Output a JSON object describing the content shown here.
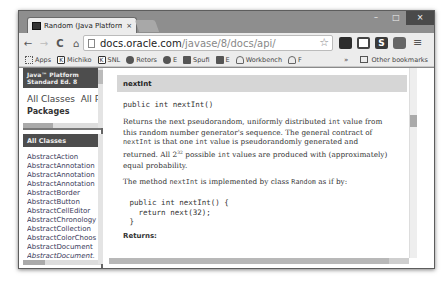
{
  "browser": {
    "tab": {
      "title": "Random (Java Platform SE",
      "close_glyph": "×"
    },
    "window_controls": {
      "minimize": "–",
      "maximize": "□",
      "close": "×"
    },
    "nav": {
      "back": "←",
      "forward": "→",
      "reload": "C",
      "home": "⌂"
    },
    "omnibox": {
      "host": "docs.oracle.com",
      "path": "/javase/8/docs/api/",
      "star": "☆"
    },
    "extensions": [
      "ext-dark-icon",
      "cast-icon",
      "s-icon",
      "ext-round-icon"
    ],
    "ext_s_label": "S",
    "menu": "≡",
    "bookmarks": [
      {
        "label": "Apps",
        "icon": "apps-grid-icon"
      },
      {
        "label": "Michiko",
        "icon": "k-icon"
      },
      {
        "label": "SNL",
        "icon": "k-icon"
      },
      {
        "label": "Retors",
        "icon": "g-icon"
      },
      {
        "label": "E",
        "icon": "ext-icon"
      },
      {
        "label": "Spufi",
        "icon": "f-icon"
      },
      {
        "label": "E",
        "icon": "f-icon"
      },
      {
        "label": "Workbench",
        "icon": "cloud-icon"
      },
      {
        "label": "F",
        "icon": "cloud-icon"
      }
    ],
    "bookmarks_more": "»",
    "other_bookmarks": "Other bookmarks"
  },
  "left_nav": {
    "banner_line1": "Java™ Platform",
    "banner_line2": "Standard Ed. 8",
    "all_classes_link": "All Classes",
    "all_profiles_link": "All P",
    "packages_heading": "Packages",
    "classes_banner": "All Classes",
    "classes": [
      {
        "name": "AbstractAction",
        "italic": false
      },
      {
        "name": "AbstractAnnotation",
        "italic": false
      },
      {
        "name": "AbstractAnnotation",
        "italic": false
      },
      {
        "name": "AbstractAnnotation",
        "italic": false
      },
      {
        "name": "AbstractBorder",
        "italic": false
      },
      {
        "name": "AbstractButton",
        "italic": false
      },
      {
        "name": "AbstractCellEditor",
        "italic": false
      },
      {
        "name": "AbstractChronology",
        "italic": false
      },
      {
        "name": "AbstractCollection",
        "italic": false
      },
      {
        "name": "AbstractColorChoos",
        "italic": false
      },
      {
        "name": "AbstractDocument",
        "italic": false
      },
      {
        "name": "AbstractDocument.",
        "italic": true
      }
    ]
  },
  "main": {
    "method_name": "nextInt",
    "signature": "public int nextInt()",
    "description": {
      "p1_a": "Returns the next pseudorandom, uniformly distributed ",
      "p1_code1": "int",
      "p1_b": " value from this random number generator's sequence. The general contract of ",
      "p1_code2": "nextInt",
      "p1_c": " is that one ",
      "p1_code3": "int",
      "p1_d": " value is pseudorandomly generated and returned. All 2",
      "p1_sup": "32",
      "p1_e": " possible ",
      "p1_code4": "int",
      "p1_f": " values are produced with (approximately) equal probability."
    },
    "implementation": {
      "a": "The method ",
      "code1": "nextInt",
      "b": " is implemented by class ",
      "code2": "Random",
      "c": " as if by:"
    },
    "code_sample": " public int nextInt() {\n   return next(32);\n }",
    "returns_label": "Returns:"
  }
}
